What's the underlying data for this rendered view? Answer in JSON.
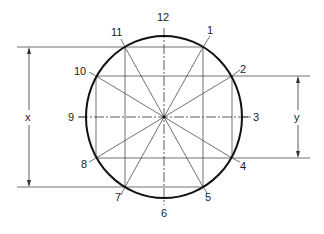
{
  "diagram": {
    "center": {
      "x": 164,
      "y": 117
    },
    "ellipse": {
      "rx": 78,
      "ry": 81
    },
    "colors": {
      "line": "#333333",
      "outline": "#111111",
      "text": "#222222",
      "background": "#ffffff"
    },
    "points": [
      {
        "id": "1",
        "x": 203,
        "y": 47,
        "label": "1",
        "lx": 207,
        "ly": 34
      },
      {
        "id": "2",
        "x": 232,
        "y": 76,
        "label": "2",
        "lx": 240,
        "ly": 73
      },
      {
        "id": "3",
        "x": 242,
        "y": 117,
        "label": "3",
        "lx": 253,
        "ly": 121
      },
      {
        "id": "4",
        "x": 232,
        "y": 158,
        "label": "4",
        "lx": 240,
        "ly": 170
      },
      {
        "id": "5",
        "x": 203,
        "y": 187,
        "label": "5",
        "lx": 205,
        "ly": 201
      },
      {
        "id": "6",
        "x": 164,
        "y": 198,
        "label": "6",
        "lx": 161,
        "ly": 217
      },
      {
        "id": "7",
        "x": 125,
        "y": 187,
        "label": "7",
        "lx": 115,
        "ly": 201
      },
      {
        "id": "8",
        "x": 96,
        "y": 158,
        "label": "8",
        "lx": 81,
        "ly": 168
      },
      {
        "id": "9",
        "x": 86,
        "y": 117,
        "label": "9",
        "lx": 68,
        "ly": 121
      },
      {
        "id": "10",
        "x": 96,
        "y": 76,
        "label": "10",
        "lx": 74,
        "ly": 75
      },
      {
        "id": "11",
        "x": 125,
        "y": 47,
        "label": "11",
        "lx": 111,
        "ly": 36
      },
      {
        "id": "12",
        "x": 164,
        "y": 36,
        "label": "12",
        "lx": 157,
        "ly": 21
      }
    ],
    "dimensions": {
      "x": {
        "label": "x",
        "line_x": 29,
        "top": 47,
        "bottom": 187,
        "ext_start": 17,
        "label_x": 25,
        "label_y": 121
      },
      "y": {
        "label": "y",
        "line_x": 298,
        "top": 76,
        "bottom": 158,
        "ext_end": 310,
        "label_x": 294,
        "label_y": 121
      }
    }
  }
}
